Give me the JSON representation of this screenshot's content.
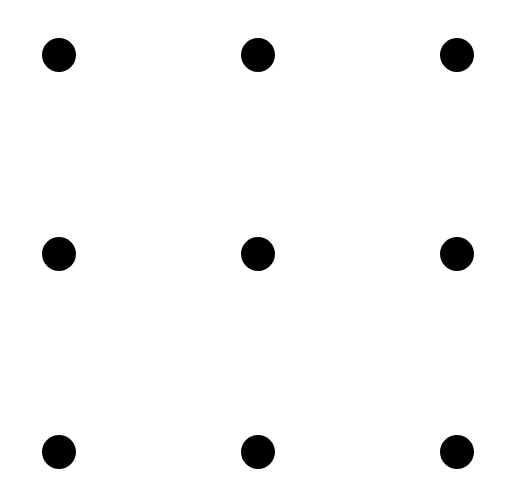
{
  "diagram": {
    "type": "dot-grid",
    "rows": 3,
    "cols": 3,
    "dot_color": "#000000",
    "background": "#ffffff",
    "dot_radius": 17,
    "column_x": [
      59,
      258,
      457
    ],
    "row_y": [
      55,
      254,
      452
    ]
  }
}
